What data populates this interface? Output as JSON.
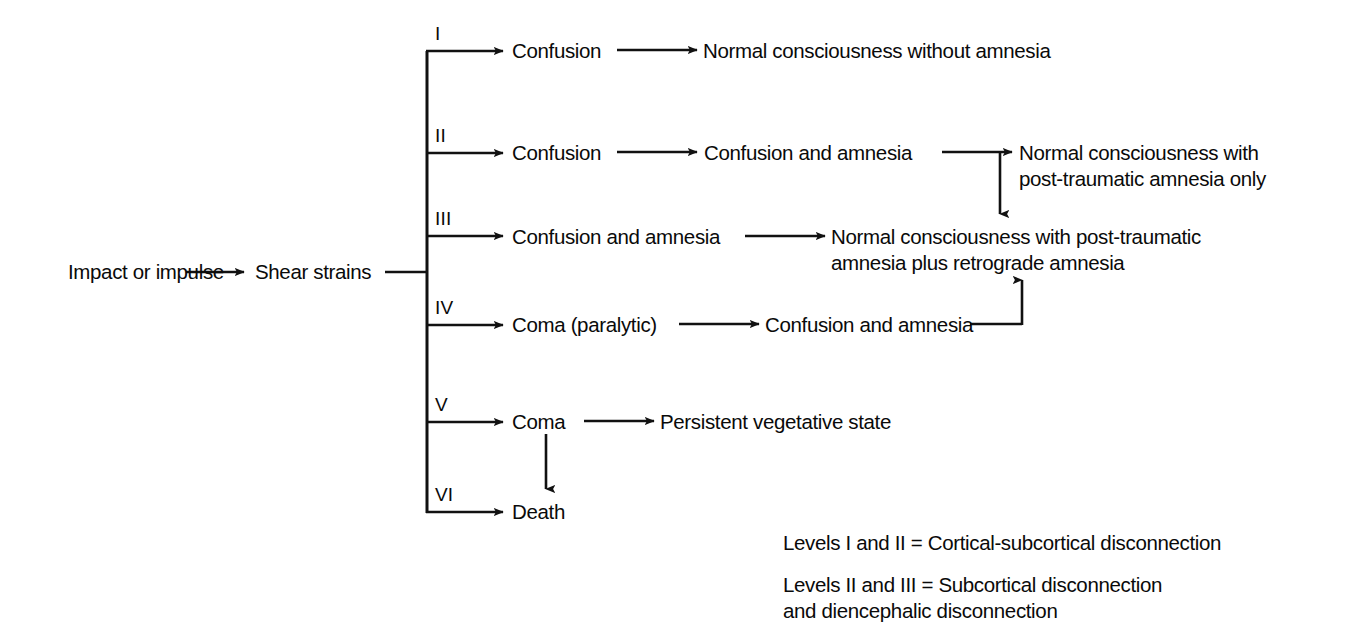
{
  "diagram": {
    "stroke_color": "#111111",
    "text_color": "#0a0a0a",
    "background": "#ffffff",
    "root": {
      "impact_label": "Impact or impulse",
      "shear_label": "Shear strains"
    },
    "levels": [
      {
        "numeral": "I",
        "stage1": "Confusion",
        "stage2": "Normal consciousness without amnesia"
      },
      {
        "numeral": "II",
        "stage1": "Confusion",
        "stage2": "Confusion and amnesia",
        "stage3": "Normal consciousness with\npost-traumatic amnesia only"
      },
      {
        "numeral": "III",
        "stage1": "Confusion and amnesia",
        "stage2": "Normal consciousness with post-traumatic\namnesia plus retrograde amnesia"
      },
      {
        "numeral": "IV",
        "stage1": "Coma (paralytic)",
        "stage2": "Confusion and amnesia"
      },
      {
        "numeral": "V",
        "stage1": "Coma",
        "stage2": "Persistent vegetative state"
      },
      {
        "numeral": "VI",
        "stage1": "Death"
      }
    ],
    "legend": [
      "Levels I and II = Cortical-subcortical disconnection",
      "Levels II and III = Subcortical disconnection\nand diencephalic disconnection"
    ]
  }
}
